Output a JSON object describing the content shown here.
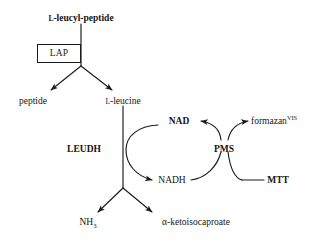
{
  "diagram": {
    "type": "enzyme-assay-pathway",
    "background_color": "#ffffff",
    "stroke_color": "#1a1a1a",
    "substrate": {
      "prefix": "L",
      "label": "-leucyl-peptide",
      "full_text": "L-leucyl-peptide"
    },
    "enzyme_box": {
      "label": "LAP"
    },
    "products": {
      "peptide": "peptide",
      "leucine_prefix": "L",
      "leucine": "-leucine",
      "leucine_full": "L-leucine"
    },
    "enzyme_second": {
      "label": "LEUDH"
    },
    "cofactors": {
      "nad": "NAD",
      "nadh": "NADH"
    },
    "mediator": {
      "label": "PMS"
    },
    "reagents": {
      "mtt": "MTT",
      "formazan": "formazan",
      "formazan_superscript": "VIS",
      "formazan_full": "formazan VIS"
    },
    "final_products": {
      "ammonia_base": "NH",
      "ammonia_subscript": "3",
      "ammonia_full": "NH3",
      "keto_acid": "α-ketoisocaproate"
    }
  }
}
